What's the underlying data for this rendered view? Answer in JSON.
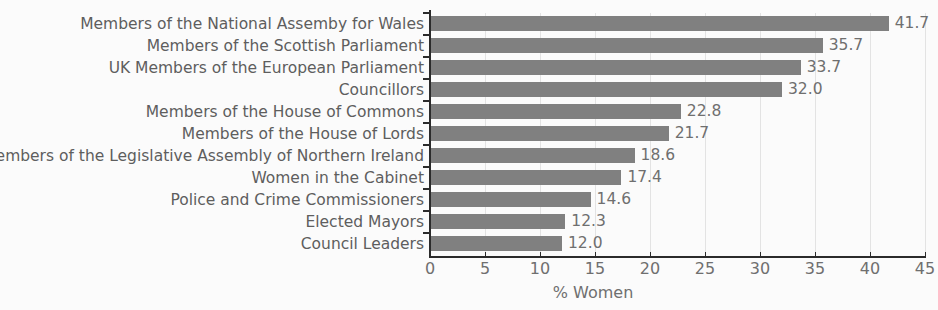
{
  "chart_data": {
    "type": "bar",
    "orientation": "horizontal",
    "title": "",
    "subtitle": "",
    "xlabel": "% Women",
    "ylabel": "",
    "xlim": [
      0,
      45
    ],
    "xticks": [
      0,
      5,
      10,
      15,
      20,
      25,
      30,
      35,
      40,
      45
    ],
    "xtick_labels": [
      "0",
      "5",
      "10",
      "15",
      "20",
      "25",
      "30",
      "35",
      "40",
      "45"
    ],
    "grid": "vertical",
    "legend": "none",
    "bar_color": "#808080",
    "text_color": "#6f6f6f",
    "axis_color": "#2b2b2b",
    "background_color": "#fbfbfb",
    "categories": [
      "Members of the National Assemby for Wales",
      "Members of the Scottish Parliament",
      "UK Members of the European Parliament",
      "Councillors",
      "Members of the House of Commons",
      "Members of the House of Lords",
      "Members of the Legislative Assembly of Northern Ireland",
      "Women in the Cabinet",
      "Police and Crime Commissioners",
      "Elected Mayors",
      "Council Leaders"
    ],
    "values": [
      41.7,
      35.7,
      33.7,
      32.0,
      22.8,
      21.7,
      18.6,
      17.4,
      14.6,
      12.3,
      12.0
    ],
    "value_labels": [
      "41.7",
      "35.7",
      "33.7",
      "32.0",
      "22.8",
      "21.7",
      "18.6",
      "17.4",
      "14.6",
      "12.3",
      "12.0"
    ]
  }
}
